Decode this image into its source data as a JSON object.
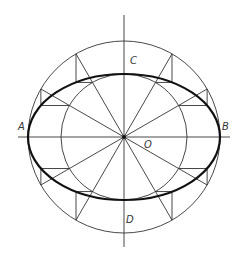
{
  "diagram": {
    "type": "ellipse-construction-concentric-circles",
    "center": {
      "x": 124,
      "y": 137
    },
    "outer_radius": 96,
    "inner_radius": 63,
    "spoke_angles_deg": [
      30,
      60,
      120,
      150,
      210,
      240,
      300,
      330
    ],
    "colors": {
      "line": "#333333",
      "ellipse": "#111111",
      "background": "#ffffff"
    },
    "labels": {
      "A": "A",
      "B": "B",
      "C": "C",
      "D": "D",
      "O": "O"
    }
  }
}
